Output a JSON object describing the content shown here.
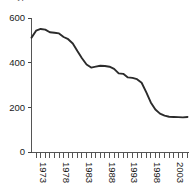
{
  "chart_data": {
    "type": "line",
    "title": "Typical measurements",
    "xlabel": "",
    "ylabel": "",
    "ylim": [
      0,
      600
    ],
    "xlim": [
      1972,
      2006
    ],
    "grid": false,
    "legend": null,
    "yticks": [
      0,
      200,
      400,
      600
    ],
    "ytick_labels": [
      "0",
      "200",
      "400",
      "600"
    ],
    "xtick_labels": [
      "1973",
      "1978",
      "1983",
      "1988",
      "1993",
      "1998",
      "2003"
    ],
    "xtick_label_years": [
      1973,
      1978,
      1983,
      1988,
      1993,
      1998,
      2003
    ],
    "xtick_label_rotation": 90,
    "minor_tick_interval_years": 1,
    "series": [
      {
        "name": "series-1",
        "color": "#2b2b2b",
        "x": [
          1972,
          1973,
          1974,
          1975,
          1976,
          1977,
          1978,
          1979,
          1980,
          1981,
          1982,
          1983,
          1984,
          1985,
          1986,
          1987,
          1988,
          1989,
          1990,
          1991,
          1992,
          1993,
          1994,
          1995,
          1996,
          1997,
          1998,
          1999,
          2000,
          2001,
          2002,
          2003,
          2004,
          2005,
          2006
        ],
        "values": [
          512,
          543,
          551,
          548,
          536,
          534,
          531,
          515,
          505,
          486,
          452,
          420,
          392,
          378,
          382,
          386,
          385,
          382,
          372,
          352,
          350,
          334,
          332,
          326,
          310,
          268,
          222,
          190,
          172,
          163,
          158,
          157,
          156,
          155,
          157
        ]
      }
    ]
  },
  "axes": {
    "y_axis_name": "y-axis",
    "x_axis_name": "x-axis"
  }
}
